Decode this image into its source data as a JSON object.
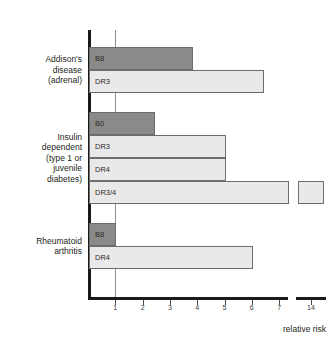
{
  "chart_data": {
    "type": "bar",
    "orientation": "horizontal",
    "title": "",
    "xlabel": "relative risk",
    "ylabel": "",
    "xlim": [
      0,
      7.6
    ],
    "grid": true,
    "gridlines": [
      1
    ],
    "legend": false,
    "axis_break": {
      "present": true,
      "after": 7.6,
      "resumes_at": 14
    },
    "tick_labels": [
      "1",
      "2",
      "3",
      "4",
      "5",
      "6",
      "7",
      "14"
    ],
    "tick_values": [
      1,
      2,
      3,
      4,
      5,
      6,
      7,
      14
    ],
    "groups": [
      {
        "label": "Addison's\ndisease\n(adrenal)",
        "bars": [
          {
            "name": "B8",
            "value": 3.8,
            "shade": "dark",
            "broken": false
          },
          {
            "name": "DR3",
            "value": 6.4,
            "shade": "light",
            "broken": false
          }
        ]
      },
      {
        "label": "Insulin\ndependent\n(type 1 or\njuvenile\ndiabetes)",
        "bars": [
          {
            "name": "B0",
            "value": 2.4,
            "shade": "dark",
            "broken": false
          },
          {
            "name": "DR3",
            "value": 5.0,
            "shade": "light",
            "broken": false
          },
          {
            "name": "DR4",
            "value": 5.0,
            "shade": "light",
            "broken": false
          },
          {
            "name": "DR3/4",
            "value": 14.0,
            "shade": "light",
            "broken": true
          }
        ]
      },
      {
        "label": "Rheumatoid\narthritis",
        "bars": [
          {
            "name": "B8",
            "value": 1.0,
            "shade": "dark",
            "broken": false
          },
          {
            "name": "DR4",
            "value": 6.0,
            "shade": "light",
            "broken": false
          }
        ]
      }
    ],
    "colors": {
      "dark_bar": "#8a8a8a",
      "light_bar": "#e9e9e9",
      "bar_outline": "#6d6d6d",
      "axis": "#1a1a1a",
      "gridline": "#8e8e93",
      "text": "#231f20",
      "background": "#ffffff"
    }
  },
  "axis": {
    "x_title": "relative risk"
  }
}
